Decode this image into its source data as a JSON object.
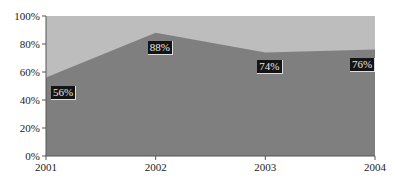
{
  "chart_data": {
    "type": "area",
    "title": "",
    "xlabel": "",
    "ylabel": "",
    "categories": [
      "2001",
      "2002",
      "2003",
      "2004"
    ],
    "series": [
      {
        "name": "Share",
        "values": [
          56,
          88,
          74,
          76
        ],
        "color": "#7f7f7f"
      },
      {
        "name": "Remainder",
        "values": [
          44,
          12,
          26,
          24
        ],
        "color": "#bdbdbd"
      }
    ],
    "stacked_percent": true,
    "data_labels": [
      "56%",
      "88%",
      "74%",
      "76%"
    ],
    "y_ticks": [
      "0%",
      "20%",
      "40%",
      "60%",
      "80%",
      "100%"
    ],
    "ylim": [
      0,
      100
    ],
    "grid": false,
    "legend": "none"
  },
  "colors": {
    "lower_area": "#7f7f7f",
    "upper_area": "#bdbdbd",
    "label_bg": "#141414",
    "label_text": "#e8e8e8",
    "axis": "#555555"
  }
}
